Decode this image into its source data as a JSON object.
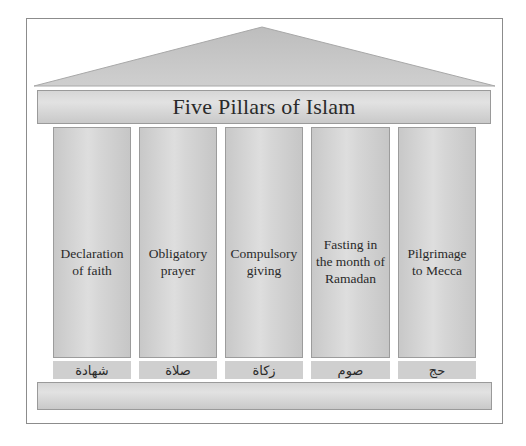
{
  "diagram": {
    "title": "Five Pillars of Islam",
    "colors": {
      "frame_border": "#8c8c8c",
      "roof_fill": "#c4c4c4",
      "pillar_fill": "#d4d4d4",
      "label_fill": "#cfcfcf",
      "text": "#2a2a2a"
    },
    "pillars": [
      {
        "label": "Declaration\nof faith",
        "arabic": "شهادة"
      },
      {
        "label": "Obligatory\nprayer",
        "arabic": "صلاة"
      },
      {
        "label": "Compulsory\ngiving",
        "arabic": "زكاة"
      },
      {
        "label": "Fasting in\nthe month of\nRamadan",
        "arabic": "صوم"
      },
      {
        "label": "Pilgrimage\nto Mecca",
        "arabic": "حج"
      }
    ]
  }
}
